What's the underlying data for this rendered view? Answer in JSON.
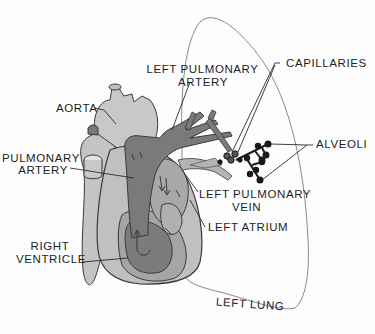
{
  "diagram": {
    "colors": {
      "outline": "#3a3a3a",
      "light_tissue": "#c8c8c8",
      "mid_tissue": "#a9a9a9",
      "dark_vessel": "#777777",
      "alveoli": "#1a1a1a",
      "lung_outline": "#888888"
    },
    "labels": {
      "aorta": "AORTA",
      "left_pulmonary_artery_1": "LEFT PULMONARY",
      "left_pulmonary_artery_2": "ARTERY",
      "capillaries": "CAPILLARIES",
      "alveoli": "ALVEOLI",
      "pulmonary_artery_1": "PULMONARY",
      "pulmonary_artery_2": "ARTERY",
      "left_pulmonary_vein_1": "LEFT PULMONARY",
      "left_pulmonary_vein_2": "VEIN",
      "left_atrium": "LEFT ATRIUM",
      "right_ventricle_1": "RIGHT",
      "right_ventricle_2": "VENTRICLE",
      "left_lung": "LEFT LUNG"
    }
  }
}
